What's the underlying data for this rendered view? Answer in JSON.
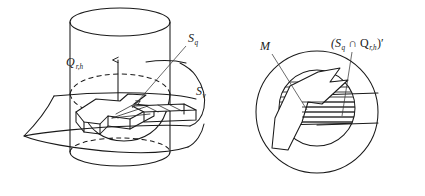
{
  "figure": {
    "title": "",
    "background_color": "#ffffff",
    "ink_color": "#1a1a1a",
    "panels": [
      {
        "id": "left-panel",
        "name": "cylinder-and-surface-perspective",
        "description": "Perspective drawing of a vertical cylinder Q_r,h intersected by a curved surface sheet S_v, with a zig-zag polygonal region and a vertical axis arrow inside.",
        "labels": [
          {
            "key": "cylinder",
            "base": "Q",
            "sub": "r,h",
            "x": 66,
            "y": 64
          },
          {
            "key": "surface-q",
            "base": "S",
            "sub": "q",
            "x": 190,
            "y": 41
          },
          {
            "key": "surface-v",
            "base": "S",
            "sub": "v",
            "x": 196,
            "y": 93
          }
        ]
      },
      {
        "id": "right-panel",
        "name": "circle-cross-section",
        "description": "Circular cross-section view: an outer circle containing an inner circle with horizontal hatching, a zig-zag polygon M, and a horizontal band labelled (S_q intersect Q_r,h)'.",
        "labels": [
          {
            "key": "region-m",
            "base": "M",
            "sub": "",
            "x": 266,
            "y": 48
          },
          {
            "key": "intersection-complement",
            "base": "(S",
            "sub": "q",
            "mid": " ∩ Q",
            "sub2": "r,h",
            "tail": ")′",
            "x": 332,
            "y": 46
          }
        ]
      }
    ],
    "label_text": {
      "cylinder_base": "Q",
      "cylinder_sub": "r,h",
      "surface_q_base": "S",
      "surface_q_sub": "q",
      "surface_v_base": "S",
      "surface_v_sub": "v",
      "region_m": "M",
      "intersection_open": "(S",
      "intersection_sub1": "q",
      "intersection_cap": " ∩ Q",
      "intersection_sub2": "r,h",
      "intersection_close": ")′"
    }
  }
}
